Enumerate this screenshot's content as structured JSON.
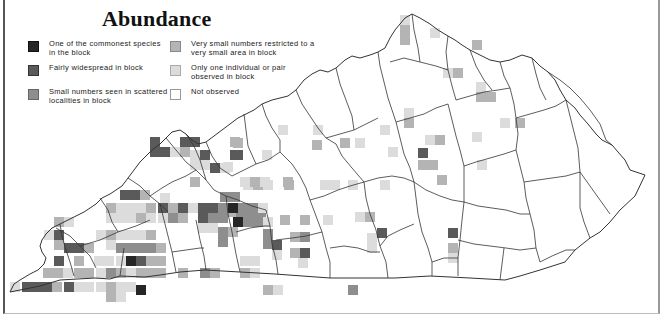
{
  "title": "Abundance",
  "legend": {
    "items": [
      {
        "key": "commonest",
        "label": "One of the commonest species in the block",
        "color": "#262626"
      },
      {
        "key": "widespread",
        "label": "Fairly widespread in block",
        "color": "#5a5a5a"
      },
      {
        "key": "scattered",
        "label": "Small numbers seen in scattered localities in block",
        "color": "#8e8e8e"
      },
      {
        "key": "restricted",
        "label": "Very small numbers restricted to a very small area in block",
        "color": "#b4b4b4"
      },
      {
        "key": "single",
        "label": "Only one individual or pair observed in block",
        "color": "#dcdcdc"
      },
      {
        "key": "not_observed",
        "label": "Not observed",
        "color": "#ffffff"
      }
    ]
  },
  "map": {
    "region": "Kentucky",
    "cell_size": 10,
    "cells": [
      {
        "x": 400,
        "y": 15,
        "level": "single"
      },
      {
        "x": 400,
        "y": 25,
        "level": "restricted"
      },
      {
        "x": 400,
        "y": 35,
        "level": "restricted"
      },
      {
        "x": 430,
        "y": 28,
        "level": "single"
      },
      {
        "x": 472,
        "y": 40,
        "level": "restricted"
      },
      {
        "x": 443,
        "y": 68,
        "level": "single"
      },
      {
        "x": 453,
        "y": 68,
        "level": "restricted"
      },
      {
        "x": 476,
        "y": 82,
        "level": "single"
      },
      {
        "x": 476,
        "y": 92,
        "level": "restricted"
      },
      {
        "x": 486,
        "y": 92,
        "level": "restricted"
      },
      {
        "x": 515,
        "y": 118,
        "level": "restricted"
      },
      {
        "x": 404,
        "y": 108,
        "level": "single"
      },
      {
        "x": 404,
        "y": 118,
        "level": "restricted"
      },
      {
        "x": 425,
        "y": 135,
        "level": "single"
      },
      {
        "x": 435,
        "y": 135,
        "level": "restricted"
      },
      {
        "x": 418,
        "y": 148,
        "level": "widespread"
      },
      {
        "x": 418,
        "y": 160,
        "level": "restricted"
      },
      {
        "x": 428,
        "y": 160,
        "level": "restricted"
      },
      {
        "x": 437,
        "y": 175,
        "level": "restricted"
      },
      {
        "x": 477,
        "y": 160,
        "level": "single"
      },
      {
        "x": 472,
        "y": 132,
        "level": "single"
      },
      {
        "x": 500,
        "y": 118,
        "level": "single"
      },
      {
        "x": 380,
        "y": 125,
        "level": "single"
      },
      {
        "x": 388,
        "y": 147,
        "level": "single"
      },
      {
        "x": 278,
        "y": 125,
        "level": "single"
      },
      {
        "x": 313,
        "y": 125,
        "level": "single"
      },
      {
        "x": 340,
        "y": 138,
        "level": "restricted"
      },
      {
        "x": 355,
        "y": 138,
        "level": "single"
      },
      {
        "x": 312,
        "y": 140,
        "level": "restricted"
      },
      {
        "x": 262,
        "y": 150,
        "level": "single"
      },
      {
        "x": 233,
        "y": 138,
        "level": "restricted"
      },
      {
        "x": 233,
        "y": 150,
        "level": "widespread"
      },
      {
        "x": 223,
        "y": 162,
        "level": "single"
      },
      {
        "x": 243,
        "y": 180,
        "level": "single"
      },
      {
        "x": 253,
        "y": 180,
        "level": "restricted"
      },
      {
        "x": 263,
        "y": 180,
        "level": "single"
      },
      {
        "x": 284,
        "y": 180,
        "level": "restricted"
      },
      {
        "x": 320,
        "y": 180,
        "level": "single"
      },
      {
        "x": 330,
        "y": 180,
        "level": "single"
      },
      {
        "x": 348,
        "y": 180,
        "level": "single"
      },
      {
        "x": 380,
        "y": 180,
        "level": "single"
      },
      {
        "x": 323,
        "y": 215,
        "level": "single"
      },
      {
        "x": 300,
        "y": 215,
        "level": "restricted"
      },
      {
        "x": 280,
        "y": 215,
        "level": "restricted"
      },
      {
        "x": 355,
        "y": 212,
        "level": "single"
      },
      {
        "x": 365,
        "y": 212,
        "level": "restricted"
      },
      {
        "x": 367,
        "y": 233,
        "level": "single"
      },
      {
        "x": 367,
        "y": 243,
        "level": "single"
      },
      {
        "x": 377,
        "y": 228,
        "level": "widespread"
      },
      {
        "x": 448,
        "y": 228,
        "level": "widespread"
      },
      {
        "x": 448,
        "y": 243,
        "level": "restricted"
      },
      {
        "x": 448,
        "y": 253,
        "level": "single"
      },
      {
        "x": 236,
        "y": 207,
        "level": "scattered"
      },
      {
        "x": 246,
        "y": 207,
        "level": "scattered"
      },
      {
        "x": 256,
        "y": 207,
        "level": "scattered"
      },
      {
        "x": 226,
        "y": 207,
        "level": "restricted"
      },
      {
        "x": 233,
        "y": 217,
        "level": "commonest"
      },
      {
        "x": 243,
        "y": 217,
        "level": "scattered"
      },
      {
        "x": 253,
        "y": 217,
        "level": "scattered"
      },
      {
        "x": 263,
        "y": 217,
        "level": "single"
      },
      {
        "x": 263,
        "y": 229,
        "level": "scattered"
      },
      {
        "x": 263,
        "y": 239,
        "level": "scattered"
      },
      {
        "x": 272,
        "y": 240,
        "level": "widespread"
      },
      {
        "x": 272,
        "y": 250,
        "level": "single"
      },
      {
        "x": 290,
        "y": 232,
        "level": "restricted"
      },
      {
        "x": 300,
        "y": 232,
        "level": "scattered"
      },
      {
        "x": 290,
        "y": 248,
        "level": "restricted"
      },
      {
        "x": 300,
        "y": 248,
        "level": "widespread"
      },
      {
        "x": 298,
        "y": 258,
        "level": "single"
      },
      {
        "x": 218,
        "y": 227,
        "level": "scattered"
      },
      {
        "x": 218,
        "y": 237,
        "level": "scattered"
      },
      {
        "x": 228,
        "y": 227,
        "level": "restricted"
      },
      {
        "x": 240,
        "y": 256,
        "level": "single"
      },
      {
        "x": 250,
        "y": 256,
        "level": "single"
      },
      {
        "x": 348,
        "y": 285,
        "level": "scattered"
      },
      {
        "x": 263,
        "y": 285,
        "level": "restricted"
      },
      {
        "x": 273,
        "y": 285,
        "level": "single"
      },
      {
        "x": 180,
        "y": 137,
        "level": "widespread"
      },
      {
        "x": 190,
        "y": 137,
        "level": "widespread"
      },
      {
        "x": 180,
        "y": 147,
        "level": "restricted"
      },
      {
        "x": 150,
        "y": 137,
        "level": "widespread"
      },
      {
        "x": 150,
        "y": 147,
        "level": "widespread"
      },
      {
        "x": 160,
        "y": 147,
        "level": "widespread"
      },
      {
        "x": 170,
        "y": 147,
        "level": "single"
      },
      {
        "x": 190,
        "y": 150,
        "level": "single"
      },
      {
        "x": 190,
        "y": 160,
        "level": "single"
      },
      {
        "x": 200,
        "y": 150,
        "level": "widespread"
      },
      {
        "x": 200,
        "y": 160,
        "level": "single"
      },
      {
        "x": 210,
        "y": 163,
        "level": "widespread"
      },
      {
        "x": 220,
        "y": 163,
        "level": "single"
      },
      {
        "x": 230,
        "y": 137,
        "level": "restricted"
      },
      {
        "x": 230,
        "y": 150,
        "level": "widespread"
      },
      {
        "x": 190,
        "y": 177,
        "level": "restricted"
      },
      {
        "x": 240,
        "y": 177,
        "level": "single"
      },
      {
        "x": 250,
        "y": 177,
        "level": "restricted"
      },
      {
        "x": 260,
        "y": 177,
        "level": "single"
      },
      {
        "x": 283,
        "y": 177,
        "level": "restricted"
      },
      {
        "x": 120,
        "y": 190,
        "level": "widespread"
      },
      {
        "x": 130,
        "y": 190,
        "level": "widespread"
      },
      {
        "x": 140,
        "y": 190,
        "level": "restricted"
      },
      {
        "x": 160,
        "y": 193,
        "level": "single"
      },
      {
        "x": 220,
        "y": 192,
        "level": "scattered"
      },
      {
        "x": 230,
        "y": 192,
        "level": "scattered"
      },
      {
        "x": 106,
        "y": 203,
        "level": "restricted"
      },
      {
        "x": 116,
        "y": 203,
        "level": "single"
      },
      {
        "x": 126,
        "y": 203,
        "level": "single"
      },
      {
        "x": 136,
        "y": 203,
        "level": "single"
      },
      {
        "x": 146,
        "y": 203,
        "level": "restricted"
      },
      {
        "x": 158,
        "y": 203,
        "level": "widespread"
      },
      {
        "x": 168,
        "y": 203,
        "level": "restricted"
      },
      {
        "x": 178,
        "y": 203,
        "level": "widespread"
      },
      {
        "x": 188,
        "y": 203,
        "level": "single"
      },
      {
        "x": 198,
        "y": 203,
        "level": "widespread"
      },
      {
        "x": 208,
        "y": 203,
        "level": "widespread"
      },
      {
        "x": 218,
        "y": 203,
        "level": "scattered"
      },
      {
        "x": 228,
        "y": 203,
        "level": "commonest"
      },
      {
        "x": 238,
        "y": 203,
        "level": "scattered"
      },
      {
        "x": 248,
        "y": 203,
        "level": "scattered"
      },
      {
        "x": 258,
        "y": 203,
        "level": "single"
      },
      {
        "x": 168,
        "y": 213,
        "level": "scattered"
      },
      {
        "x": 178,
        "y": 213,
        "level": "restricted"
      },
      {
        "x": 198,
        "y": 213,
        "level": "widespread"
      },
      {
        "x": 208,
        "y": 213,
        "level": "scattered"
      },
      {
        "x": 218,
        "y": 213,
        "level": "scattered"
      },
      {
        "x": 106,
        "y": 213,
        "level": "single"
      },
      {
        "x": 116,
        "y": 213,
        "level": "single"
      },
      {
        "x": 126,
        "y": 213,
        "level": "single"
      },
      {
        "x": 136,
        "y": 213,
        "level": "restricted"
      },
      {
        "x": 146,
        "y": 213,
        "level": "single"
      },
      {
        "x": 158,
        "y": 213,
        "level": "single"
      },
      {
        "x": 198,
        "y": 223,
        "level": "single"
      },
      {
        "x": 208,
        "y": 223,
        "level": "single"
      },
      {
        "x": 54,
        "y": 217,
        "level": "restricted"
      },
      {
        "x": 64,
        "y": 217,
        "level": "single"
      },
      {
        "x": 44,
        "y": 230,
        "level": "single"
      },
      {
        "x": 54,
        "y": 230,
        "level": "widespread"
      },
      {
        "x": 96,
        "y": 230,
        "level": "single"
      },
      {
        "x": 106,
        "y": 230,
        "level": "restricted"
      },
      {
        "x": 116,
        "y": 230,
        "level": "single"
      },
      {
        "x": 126,
        "y": 230,
        "level": "single"
      },
      {
        "x": 136,
        "y": 230,
        "level": "single"
      },
      {
        "x": 146,
        "y": 230,
        "level": "restricted"
      },
      {
        "x": 54,
        "y": 240,
        "level": "restricted"
      },
      {
        "x": 64,
        "y": 243,
        "level": "widespread"
      },
      {
        "x": 74,
        "y": 243,
        "level": "widespread"
      },
      {
        "x": 84,
        "y": 243,
        "level": "restricted"
      },
      {
        "x": 106,
        "y": 240,
        "level": "single"
      },
      {
        "x": 116,
        "y": 243,
        "level": "scattered"
      },
      {
        "x": 126,
        "y": 243,
        "level": "scattered"
      },
      {
        "x": 136,
        "y": 243,
        "level": "scattered"
      },
      {
        "x": 146,
        "y": 243,
        "level": "scattered"
      },
      {
        "x": 156,
        "y": 243,
        "level": "restricted"
      },
      {
        "x": 54,
        "y": 256,
        "level": "widespread"
      },
      {
        "x": 74,
        "y": 256,
        "level": "restricted"
      },
      {
        "x": 94,
        "y": 256,
        "level": "single"
      },
      {
        "x": 104,
        "y": 256,
        "level": "single"
      },
      {
        "x": 116,
        "y": 256,
        "level": "single"
      },
      {
        "x": 126,
        "y": 256,
        "level": "commonest"
      },
      {
        "x": 136,
        "y": 256,
        "level": "widespread"
      },
      {
        "x": 146,
        "y": 256,
        "level": "restricted"
      },
      {
        "x": 156,
        "y": 256,
        "level": "restricted"
      },
      {
        "x": 43,
        "y": 268,
        "level": "restricted"
      },
      {
        "x": 53,
        "y": 268,
        "level": "restricted"
      },
      {
        "x": 63,
        "y": 268,
        "level": "single"
      },
      {
        "x": 74,
        "y": 268,
        "level": "restricted"
      },
      {
        "x": 84,
        "y": 268,
        "level": "restricted"
      },
      {
        "x": 96,
        "y": 268,
        "level": "single"
      },
      {
        "x": 106,
        "y": 268,
        "level": "scattered"
      },
      {
        "x": 116,
        "y": 268,
        "level": "restricted"
      },
      {
        "x": 126,
        "y": 268,
        "level": "single"
      },
      {
        "x": 136,
        "y": 268,
        "level": "restricted"
      },
      {
        "x": 146,
        "y": 268,
        "level": "restricted"
      },
      {
        "x": 156,
        "y": 268,
        "level": "restricted"
      },
      {
        "x": 178,
        "y": 268,
        "level": "restricted"
      },
      {
        "x": 200,
        "y": 268,
        "level": "scattered"
      },
      {
        "x": 210,
        "y": 268,
        "level": "restricted"
      },
      {
        "x": 240,
        "y": 268,
        "level": "restricted"
      },
      {
        "x": 250,
        "y": 268,
        "level": "single"
      },
      {
        "x": 10,
        "y": 282,
        "level": "single"
      },
      {
        "x": 22,
        "y": 282,
        "level": "widespread"
      },
      {
        "x": 32,
        "y": 282,
        "level": "widespread"
      },
      {
        "x": 42,
        "y": 282,
        "level": "widespread"
      },
      {
        "x": 52,
        "y": 282,
        "level": "restricted"
      },
      {
        "x": 64,
        "y": 282,
        "level": "widespread"
      },
      {
        "x": 74,
        "y": 282,
        "level": "single"
      },
      {
        "x": 84,
        "y": 282,
        "level": "single"
      },
      {
        "x": 96,
        "y": 282,
        "level": "single"
      },
      {
        "x": 106,
        "y": 282,
        "level": "restricted"
      },
      {
        "x": 116,
        "y": 282,
        "level": "single"
      },
      {
        "x": 126,
        "y": 282,
        "level": "single"
      },
      {
        "x": 136,
        "y": 285,
        "level": "commonest"
      },
      {
        "x": 106,
        "y": 292,
        "level": "restricted"
      },
      {
        "x": 116,
        "y": 292,
        "level": "single"
      }
    ]
  }
}
